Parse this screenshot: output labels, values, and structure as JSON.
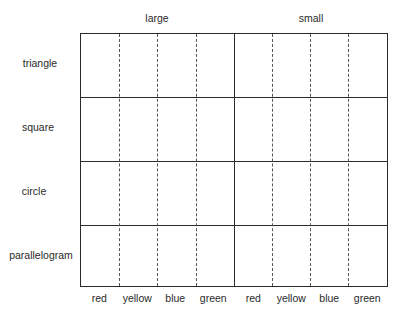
{
  "diagram": {
    "groups": [
      {
        "label": "large"
      },
      {
        "label": "small"
      }
    ],
    "rows": [
      {
        "label": "triangle"
      },
      {
        "label": "square"
      },
      {
        "label": "circle"
      },
      {
        "label": "parallelogram"
      }
    ],
    "columns": [
      {
        "label": "red"
      },
      {
        "label": "yellow"
      },
      {
        "label": "blue"
      },
      {
        "label": "green"
      },
      {
        "label": "red"
      },
      {
        "label": "yellow"
      },
      {
        "label": "blue"
      },
      {
        "label": "green"
      }
    ]
  }
}
